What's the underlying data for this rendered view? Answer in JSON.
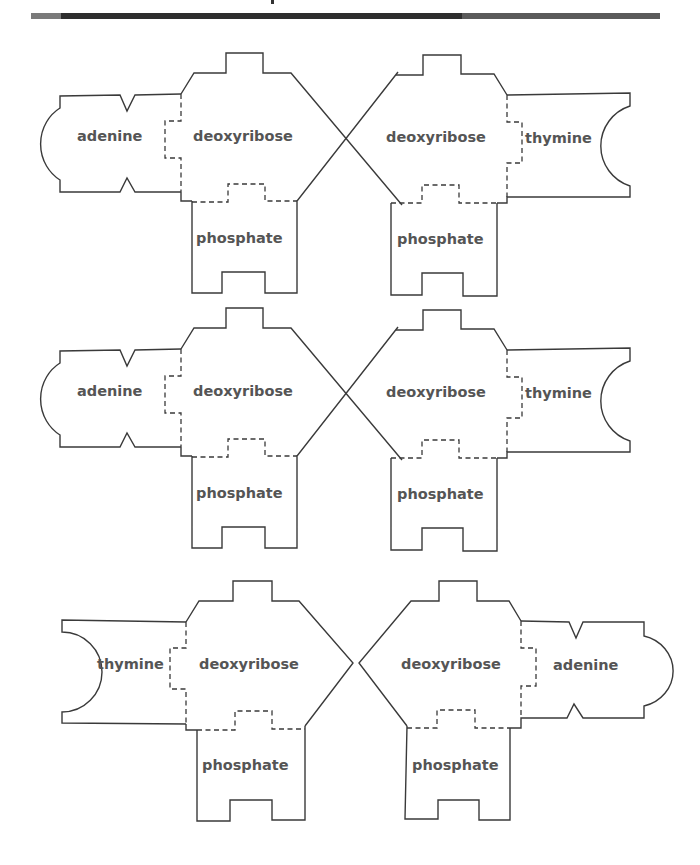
{
  "header": {
    "title_fragment": "",
    "rule": "horizontal-header-rule"
  },
  "colors": {
    "outline": "#3a3a3a",
    "label": "#555555",
    "background": "#ffffff"
  },
  "rows": [
    {
      "left_unit": {
        "base": "adenine",
        "sugar": "deoxyribose",
        "phosphate": "phosphate"
      },
      "right_unit": {
        "base": "thymine",
        "sugar": "deoxyribose",
        "phosphate": "phosphate"
      },
      "sugars_joined": "crossed"
    },
    {
      "left_unit": {
        "base": "adenine",
        "sugar": "deoxyribose",
        "phosphate": "phosphate"
      },
      "right_unit": {
        "base": "thymine",
        "sugar": "deoxyribose",
        "phosphate": "phosphate"
      },
      "sugars_joined": "crossed"
    },
    {
      "left_unit": {
        "base": "thymine",
        "sugar": "deoxyribose",
        "phosphate": "phosphate"
      },
      "right_unit": {
        "base": "adenine",
        "sugar": "deoxyribose",
        "phosphate": "phosphate"
      },
      "sugars_joined": "separate"
    }
  ]
}
